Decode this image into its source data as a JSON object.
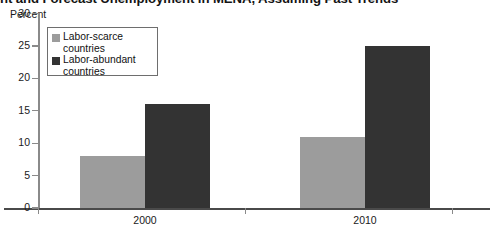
{
  "chart_data": {
    "type": "bar",
    "title": "nt and Forecast Unemployment in MENA, Assuming Past Trends",
    "subtitle": "",
    "xlabel": "",
    "ylabel": "Percent",
    "categories": [
      "2000",
      "2010"
    ],
    "series": [
      {
        "name": "Labor-scarce countries",
        "values": [
          8,
          11
        ],
        "color": "#9c9c9c"
      },
      {
        "name": "Labor-abundant countries",
        "values": [
          16,
          25
        ],
        "color": "#333333"
      }
    ],
    "ylim": [
      0,
      30
    ],
    "ytick_labels": [
      "30",
      "25",
      "20",
      "15",
      "10",
      "5",
      "0"
    ],
    "ytick_values": [
      30,
      25,
      20,
      15,
      10,
      5,
      0
    ],
    "grid": false,
    "legend_position": "top-left"
  },
  "axis": {
    "unit_label": "Percent"
  },
  "legend": {
    "items": [
      {
        "label": "Labor-scarce\ncountries",
        "color": "#9c9c9c"
      },
      {
        "label": "Labor-abundant\ncountries",
        "color": "#333333"
      }
    ]
  }
}
